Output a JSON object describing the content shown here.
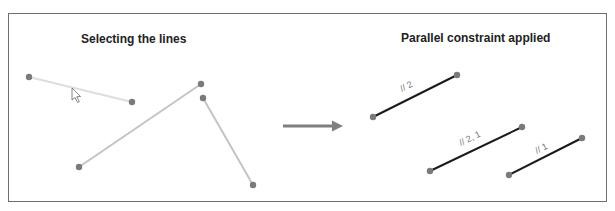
{
  "figure": {
    "left_panel": {
      "title": "Selecting the lines",
      "lines": [
        {
          "x1": 29,
          "y1": 77,
          "x2": 132,
          "y2": 102,
          "state": "hovered"
        },
        {
          "x1": 79,
          "y1": 167,
          "x2": 201,
          "y2": 84,
          "state": "selected"
        },
        {
          "x1": 203,
          "y1": 98,
          "x2": 253,
          "y2": 185,
          "state": "selected"
        }
      ],
      "cursor": {
        "x": 72,
        "y": 88,
        "icon": "mouse-pointer-icon"
      }
    },
    "arrow": {
      "icon": "right-arrow-icon",
      "from_x": 283,
      "to_x": 342,
      "y": 126
    },
    "right_panel": {
      "title": "Parallel constraint applied",
      "lines": [
        {
          "x1": 373,
          "y1": 117,
          "x2": 457,
          "y2": 75,
          "label": "// 2"
        },
        {
          "x1": 430,
          "y1": 171,
          "x2": 522,
          "y2": 127,
          "label": "// 2, 1"
        },
        {
          "x1": 509,
          "y1": 175,
          "x2": 582,
          "y2": 138,
          "label": "// 1"
        }
      ]
    },
    "colors": {
      "point": "#7a7a7a",
      "selected_line": "#c4c4c4",
      "hover_line": "#dedede",
      "constrained_line": "#1a1a1a",
      "arrow": "#7f7f7f",
      "frame": "#6e6e6e"
    }
  }
}
